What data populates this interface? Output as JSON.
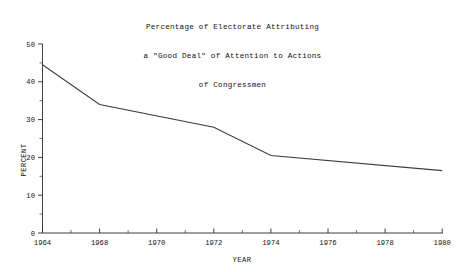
{
  "chart_data": {
    "type": "line",
    "title": "Percentage of Electorate Attributing a \"Good Deal\" of Attention to Actions of Congressmen",
    "title_lines": [
      "Percentage of Electorate Attributing",
      "a \"Good Deal\" of Attention to Actions",
      "of Congressmen"
    ],
    "xlabel": "YEAR",
    "ylabel": "PERCENT",
    "x": [
      1964,
      1968,
      1972,
      1974,
      1980
    ],
    "values": [
      44.5,
      34.0,
      28.0,
      20.5,
      16.5
    ],
    "series": [
      {
        "name": "Percent attributing a good deal of attention",
        "points": [
          {
            "year": 1964,
            "percent": 44.5
          },
          {
            "year": 1968,
            "percent": 34.0
          },
          {
            "year": 1972,
            "percent": 28.0
          },
          {
            "year": 1974,
            "percent": 20.5
          },
          {
            "year": 1980,
            "percent": 16.5
          }
        ]
      }
    ],
    "xlim": [
      1964,
      1980
    ],
    "ylim": [
      0,
      50
    ],
    "xticks": [
      1964,
      1968,
      1970,
      1972,
      1974,
      1976,
      1978,
      1980
    ],
    "xtick_labels": [
      "1964",
      "1968",
      "1970",
      "1972",
      "1974",
      "1976",
      "1978",
      "1980"
    ],
    "xticks_minor": [
      1966,
      1969,
      1971,
      1973,
      1975,
      1977,
      1979
    ],
    "yticks": [
      0,
      10,
      20,
      30,
      40,
      50
    ],
    "ytick_labels": [
      "0",
      "10",
      "20",
      "30",
      "40",
      "50"
    ],
    "yticks_minor": [
      5,
      15,
      25,
      35,
      45
    ],
    "grid": false,
    "legend": false,
    "line_color": "#3b3b3b",
    "axis_color": "#2b2b2b",
    "background": "#ffffff"
  }
}
